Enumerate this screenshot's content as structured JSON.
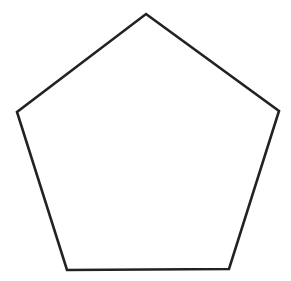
{
  "diagram": {
    "shape": "regular-pentagon",
    "background": "#ffffff",
    "stroke_color": "#222222",
    "fill_color": "#ffffff",
    "stroke_width": 2.6,
    "vertices": [
      {
        "name": "top",
        "x": 146,
        "y": 14
      },
      {
        "name": "right",
        "x": 279,
        "y": 111
      },
      {
        "name": "bottom-right",
        "x": 229,
        "y": 269
      },
      {
        "name": "bottom-left",
        "x": 67,
        "y": 270
      },
      {
        "name": "left",
        "x": 17,
        "y": 112
      }
    ]
  }
}
